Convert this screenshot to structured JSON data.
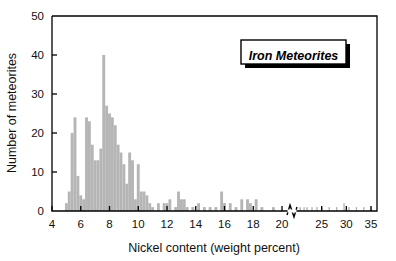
{
  "figure": {
    "background_color": "#ffffff",
    "frame_color": "#000000",
    "bar_color": "#b5b5b5"
  },
  "legend": {
    "label": "Iron Meteorites",
    "box_fill": "#ffffff",
    "box_border": "#000000",
    "shadow_color": "#000000"
  },
  "chart_data": {
    "type": "bar",
    "title": "",
    "subtitle": "",
    "xlabel": "Nickel content (weight percent)",
    "ylabel": "Number of meteorites",
    "annotations": [
      "Iron Meteorites"
    ],
    "legend_entries": [
      "Iron Meteorites"
    ],
    "legend_position": "top-right",
    "grid": false,
    "axis_break": {
      "present": true,
      "after_tick": 20,
      "before_tick": 25,
      "symbol": "zigzag"
    },
    "xlim": [
      4,
      35
    ],
    "ylim": [
      0,
      50
    ],
    "xticks": [
      4,
      6,
      8,
      10,
      12,
      14,
      16,
      18,
      20,
      25,
      30,
      35
    ],
    "xtick_labels": [
      "4",
      "6",
      "8",
      "10",
      "12",
      "14",
      "16",
      "18",
      "20",
      "25",
      "30",
      "35"
    ],
    "yticks": [
      0,
      10,
      20,
      30,
      40,
      50
    ],
    "ytick_labels": [
      "0",
      "10",
      "20",
      "30",
      "40",
      "50"
    ],
    "bin_width": 0.2,
    "categories": [
      5.0,
      5.2,
      5.4,
      5.6,
      5.8,
      6.0,
      6.2,
      6.4,
      6.6,
      6.8,
      7.0,
      7.2,
      7.4,
      7.6,
      7.8,
      8.0,
      8.2,
      8.4,
      8.6,
      8.8,
      9.0,
      9.2,
      9.4,
      9.6,
      9.8,
      10.0,
      10.2,
      10.4,
      10.6,
      10.8,
      11.0,
      11.4,
      11.8,
      12.0,
      12.2,
      12.6,
      12.8,
      13.0,
      13.2,
      13.4,
      13.8,
      14.2,
      14.6,
      15.0,
      15.4,
      15.8,
      16.0,
      16.4,
      16.8,
      17.2,
      17.6,
      17.8,
      18.2,
      18.6,
      19.4,
      20.6,
      21.4,
      22.0,
      23.0,
      24.0,
      25.0,
      26.5,
      28.0,
      29.5,
      30.5,
      32.0,
      33.5,
      35.0
    ],
    "values": [
      2,
      5,
      20,
      24,
      9,
      4,
      3,
      24,
      23,
      17,
      13,
      13,
      16,
      40,
      27,
      25,
      24,
      22,
      17,
      15,
      12,
      7,
      15,
      13,
      3,
      12,
      5,
      5,
      4,
      2,
      1,
      2,
      2,
      2,
      3,
      1,
      5,
      3,
      3,
      1,
      1,
      2,
      1,
      1,
      1,
      5,
      2,
      2,
      1,
      3,
      3,
      2,
      3,
      1,
      1,
      1,
      1,
      1,
      1,
      1,
      1,
      1,
      1,
      2,
      1,
      1,
      1,
      1
    ],
    "peak": {
      "x": 7.6,
      "y": 40
    }
  }
}
